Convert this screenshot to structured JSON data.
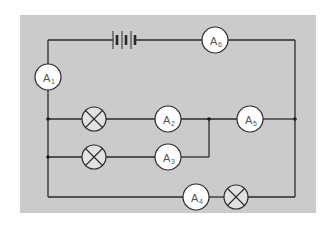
{
  "diagram": {
    "type": "circuit",
    "background_color": "#cbcbcb",
    "wire_color": "#2a2a2a",
    "components": {
      "battery": {
        "label": "battery",
        "cells": 3
      },
      "ammeters": [
        {
          "id": "A1",
          "main": "A",
          "sub": "1"
        },
        {
          "id": "A2",
          "main": "A",
          "sub": "2"
        },
        {
          "id": "A3",
          "main": "A",
          "sub": "3"
        },
        {
          "id": "A4",
          "main": "A",
          "sub": "4"
        },
        {
          "id": "A5",
          "main": "A",
          "sub": "5"
        },
        {
          "id": "A6",
          "main": "A",
          "sub": "6"
        }
      ],
      "lamps": [
        {
          "id": "lamp-1",
          "branch": "with A2"
        },
        {
          "id": "lamp-2",
          "branch": "with A3"
        },
        {
          "id": "lamp-3",
          "branch": "with A4"
        }
      ]
    }
  }
}
